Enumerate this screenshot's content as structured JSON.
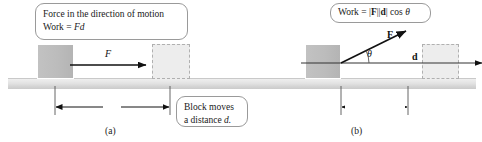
{
  "figure": {
    "width": 482,
    "height": 142,
    "colors": {
      "ground": "#dcdcdc",
      "block_solid": "#bcbcbc",
      "block_dashed_fill": "#ededed",
      "block_dashed_border": "#b0b0b0",
      "line": "#1a1a1a",
      "callout_border": "#9a9a9a"
    }
  },
  "panel_a": {
    "tag": "(a)",
    "callout_force": {
      "line1": "Force in the direction of motion",
      "line2_prefix": "Work = ",
      "line2_math": "Fd"
    },
    "force_label": "F",
    "distance_label": "d",
    "callout_block": {
      "line1": "Block moves",
      "line2_prefix": "a distance ",
      "line2_math": "d."
    }
  },
  "panel_b": {
    "tag": "(b)",
    "callout_work": {
      "prefix": "Work = ",
      "magF_open": "|",
      "magF_sym": "F",
      "magF_close": "|",
      "magd_open": "|",
      "magd_sym": "d",
      "magd_close": "|",
      "suffix": " cos ",
      "theta": "θ"
    },
    "force_label": "F",
    "displacement_label": "d",
    "angle_label": "θ",
    "projection_label": {
      "bar_open": "|",
      "sym": "F",
      "bar_close": "|",
      "cos": " cos ",
      "theta": "θ"
    }
  }
}
